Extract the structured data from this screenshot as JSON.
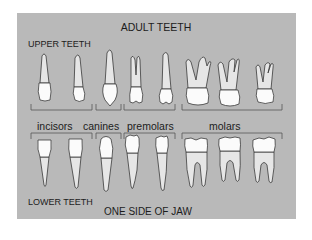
{
  "diagram": {
    "title": "ADULT TEETH",
    "upper_label": "UPPER TEETH",
    "lower_label": "LOWER TEETH",
    "footer": "ONE SIDE OF JAW",
    "groups": [
      {
        "label": "incisors",
        "tooth_count": 2
      },
      {
        "label": "canines",
        "tooth_count": 1
      },
      {
        "label": "premolars",
        "tooth_count": 2
      },
      {
        "label": "molars",
        "tooth_count": 3
      }
    ],
    "colors": {
      "panel": "#b9b9b9",
      "crown": "#fbfbfb",
      "root": "#e6e6e6",
      "text": "#1c1c1c"
    }
  }
}
